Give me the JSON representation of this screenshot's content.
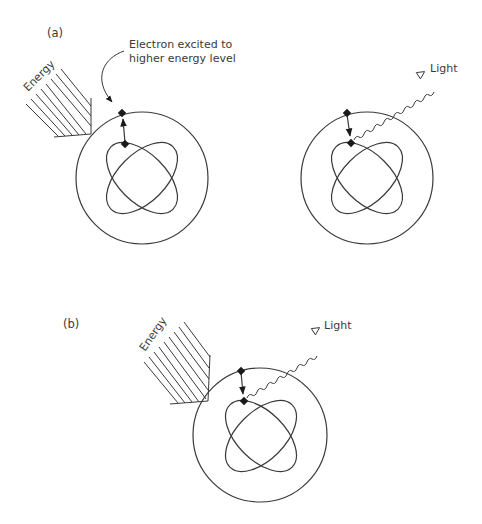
{
  "panels": [
    {
      "id": "a",
      "label": "(a)",
      "energy_label": "Energy",
      "callout_label_line1": "Electron excited to",
      "callout_label_line2": "higher energy level",
      "description": "Energy absorbed; electron jumps from inner orbit to outer shell"
    },
    {
      "id": "a-emit",
      "light_label": "Light",
      "description": "Electron returns to inner orbit, emitting light"
    },
    {
      "id": "b",
      "label": "(b)",
      "energy_label": "Energy",
      "light_label": "Light",
      "description": "Energy absorbed and light emitted"
    }
  ],
  "colors": {
    "line": "#3a3a3a",
    "electron": "#1a1a1a",
    "background": "#ffffff"
  }
}
